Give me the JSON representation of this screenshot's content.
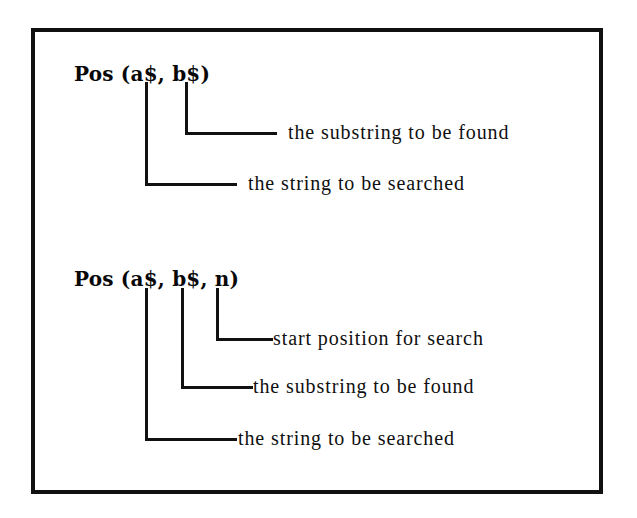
{
  "figure": {
    "background_color": "#ffffff",
    "border_color": "#111111",
    "line_color": "#111111",
    "text_color": "#101010"
  },
  "blocks": [
    {
      "id": "pos-two-arg",
      "syntax": "Pos (a$, b$)",
      "annotations": [
        {
          "id": "substring-found-1",
          "label": "the substring to be found",
          "argument": "b$"
        },
        {
          "id": "string-searched-1",
          "label": "the string to be searched",
          "argument": "a$"
        }
      ]
    },
    {
      "id": "pos-three-arg",
      "syntax": "Pos (a$, b$, n)",
      "annotations": [
        {
          "id": "start-position-2",
          "label": "start position for search",
          "argument": "n"
        },
        {
          "id": "substring-found-2",
          "label": "the substring to be found",
          "argument": "b$"
        },
        {
          "id": "string-searched-2",
          "label": "the string to be searched",
          "argument": "a$"
        }
      ]
    }
  ]
}
